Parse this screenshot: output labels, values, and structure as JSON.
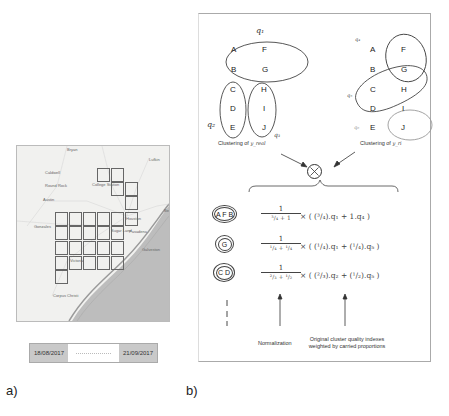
{
  "panel_a": {
    "label": "a)",
    "map": {
      "places": [
        {
          "name": "Bryan",
          "x": 50,
          "y": 2
        },
        {
          "name": "Lufkin",
          "x": 132,
          "y": 12
        },
        {
          "name": "Caldwell",
          "x": 28,
          "y": 25
        },
        {
          "name": "Round Rock",
          "x": 28,
          "y": 38
        },
        {
          "name": "Austin",
          "x": 26,
          "y": 52
        },
        {
          "name": "College Station",
          "x": 75,
          "y": 37
        },
        {
          "name": "Beaumont",
          "x": 147,
          "y": 63
        },
        {
          "name": "Houston",
          "x": 109,
          "y": 71
        },
        {
          "name": "Sugar Land",
          "x": 94,
          "y": 83
        },
        {
          "name": "Pasadena",
          "x": 112,
          "y": 84
        },
        {
          "name": "Galveston",
          "x": 125,
          "y": 102
        },
        {
          "name": "Victoria",
          "x": 53,
          "y": 113
        },
        {
          "name": "Gonzales",
          "x": 17,
          "y": 79
        },
        {
          "name": "Corpus Christi",
          "x": 36,
          "y": 148
        }
      ],
      "grid_cells": [
        [
          96,
          22
        ],
        [
          110,
          22
        ],
        [
          110,
          36
        ],
        [
          124,
          36
        ],
        [
          124,
          50
        ],
        [
          54,
          66
        ],
        [
          68,
          66
        ],
        [
          82,
          66
        ],
        [
          96,
          66
        ],
        [
          110,
          66
        ],
        [
          124,
          66
        ],
        [
          54,
          80
        ],
        [
          68,
          80
        ],
        [
          82,
          80
        ],
        [
          96,
          80
        ],
        [
          110,
          80
        ],
        [
          54,
          95
        ],
        [
          68,
          95
        ],
        [
          82,
          95
        ],
        [
          96,
          95
        ],
        [
          110,
          95
        ],
        [
          54,
          110
        ],
        [
          68,
          110
        ],
        [
          82,
          110
        ],
        [
          96,
          110
        ],
        [
          110,
          110
        ],
        [
          54,
          124
        ]
      ]
    },
    "date_range": {
      "start": "18/08/2017",
      "end": "21/09/2017"
    }
  },
  "panel_b": {
    "label": "b)",
    "left_clustering": {
      "caption": "Clustering of ",
      "caption_var": "y_real",
      "clusters": [
        {
          "name": "q₁",
          "letters": [
            "A",
            "F",
            "B",
            "G"
          ]
        },
        {
          "name": "q₂",
          "letters": [
            "C",
            "D",
            "E"
          ]
        },
        {
          "name": "q₃",
          "letters": [
            "H",
            "I",
            "J"
          ]
        }
      ]
    },
    "right_clustering": {
      "caption": "Clustering of ",
      "caption_var": "y_ri",
      "clusters": [
        {
          "name": "q₄",
          "letters": [
            "A",
            "F",
            "B"
          ]
        },
        {
          "name": "q₅",
          "letters": [
            "G",
            "C",
            "H",
            "D"
          ]
        },
        {
          "name": "q₆",
          "letters": [
            "I",
            "E",
            "J"
          ]
        }
      ]
    },
    "combine_symbol": "⊗",
    "rows": [
      {
        "group": "A F B",
        "numerator": "1",
        "denominator": "³/₄ + 1",
        "expression": "× ( (³/₄).q₁ + 1.q₄ )"
      },
      {
        "group": "G",
        "numerator": "1",
        "denominator": "¹/₄ + ¹/₄",
        "expression": "× ( (¹/₄).q₁ + (¹/₄).q₅ )"
      },
      {
        "group": "C D",
        "numerator": "1",
        "denominator": "²/₃ + ¹/₂",
        "expression": "× ( (²/₃).q₂ + (¹/₂).q₅ )"
      }
    ],
    "annotations": {
      "normalization": "Normalization",
      "original_line1": "Original cluster quality indexes",
      "original_line2": "weighted by carried proportions"
    }
  }
}
